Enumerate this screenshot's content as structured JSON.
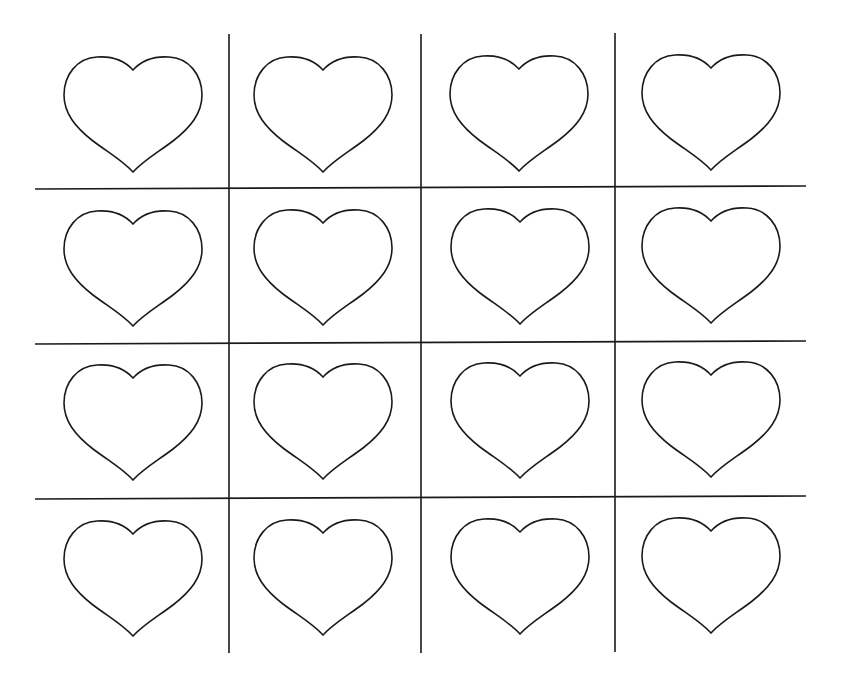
{
  "worksheet": {
    "description": "Grid of 16 outlined hearts in a 4x4 layout separated by lines",
    "rows": 4,
    "columns": 4,
    "line_color": "#1a1a1a",
    "background": "#ffffff",
    "vertical_lines": [
      {
        "x": 229,
        "y1": 34,
        "y2": 653
      },
      {
        "x": 421,
        "y1": 34,
        "y2": 653
      },
      {
        "x": 615,
        "y1": 33,
        "y2": 652
      }
    ],
    "horizontal_lines": [
      {
        "x1": 35,
        "y1": 189,
        "x2": 806,
        "y2": 186
      },
      {
        "x1": 35,
        "y1": 344,
        "x2": 806,
        "y2": 341
      },
      {
        "x1": 35,
        "y1": 499,
        "x2": 806,
        "y2": 496
      }
    ],
    "hearts": [
      {
        "cx": 133,
        "top": 57
      },
      {
        "cx": 323,
        "top": 57
      },
      {
        "cx": 519,
        "top": 56
      },
      {
        "cx": 711,
        "top": 55
      },
      {
        "cx": 133,
        "top": 211
      },
      {
        "cx": 323,
        "top": 210
      },
      {
        "cx": 520,
        "top": 209
      },
      {
        "cx": 711,
        "top": 208
      },
      {
        "cx": 133,
        "top": 365
      },
      {
        "cx": 323,
        "top": 364
      },
      {
        "cx": 520,
        "top": 363
      },
      {
        "cx": 711,
        "top": 362
      },
      {
        "cx": 133,
        "top": 521
      },
      {
        "cx": 323,
        "top": 520
      },
      {
        "cx": 520,
        "top": 519
      },
      {
        "cx": 711,
        "top": 518
      }
    ],
    "heart_size": {
      "width": 138,
      "height": 115
    }
  }
}
